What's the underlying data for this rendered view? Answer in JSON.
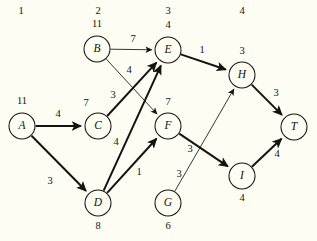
{
  "diagram": {
    "background_color": "#fdfdf4",
    "ink_color": "#14130f",
    "column_headers": [
      {
        "label": "1",
        "x": 21,
        "y": 14
      },
      {
        "label": "2",
        "x": 98,
        "y": 14
      },
      {
        "label": "3",
        "x": 168,
        "y": 14
      },
      {
        "label": "4",
        "x": 242,
        "y": 14
      }
    ],
    "nodes": [
      {
        "id": "A",
        "label": "A",
        "value": "11",
        "cx": 22,
        "cy": 126,
        "r": 13,
        "value_x": 22,
        "value_y": 104
      },
      {
        "id": "B",
        "label": "B",
        "value": "11",
        "cx": 97,
        "cy": 49,
        "r": 13,
        "value_x": 97,
        "value_y": 27
      },
      {
        "id": "C",
        "label": "C",
        "value": "7",
        "cx": 98,
        "cy": 126,
        "r": 13,
        "value_x": 86,
        "value_y": 106
      },
      {
        "id": "D",
        "label": "D",
        "value": "8",
        "cx": 98,
        "cy": 203,
        "r": 13,
        "value_x": 98,
        "value_y": 229
      },
      {
        "id": "E",
        "label": "E",
        "value": "4",
        "cx": 168,
        "cy": 50,
        "r": 13,
        "value_x": 168,
        "value_y": 28
      },
      {
        "id": "F",
        "label": "F",
        "value": "7",
        "cx": 168,
        "cy": 126,
        "r": 13,
        "value_x": 168,
        "value_y": 105
      },
      {
        "id": "G",
        "label": "G",
        "value": "6",
        "cx": 168,
        "cy": 203,
        "r": 13,
        "value_x": 168,
        "value_y": 229
      },
      {
        "id": "H",
        "label": "H",
        "value": "3",
        "cx": 242,
        "cy": 75,
        "r": 13,
        "value_x": 242,
        "value_y": 54
      },
      {
        "id": "I",
        "label": "I",
        "value": "4",
        "cx": 242,
        "cy": 176,
        "r": 13,
        "value_x": 242,
        "value_y": 201
      },
      {
        "id": "T",
        "label": "T",
        "value": "",
        "cx": 294,
        "cy": 127,
        "r": 13,
        "value_x": 294,
        "value_y": 150
      }
    ],
    "edges": [
      {
        "id": "A-C",
        "from": "A",
        "to": "C",
        "weight": "4",
        "style": "thick",
        "arrow": true,
        "label_x": 58,
        "label_y": 117
      },
      {
        "id": "A-D",
        "from": "A",
        "to": "D",
        "weight": "3",
        "style": "thick",
        "arrow": true,
        "label_x": 50,
        "label_y": 184
      },
      {
        "id": "B-E",
        "from": "B",
        "to": "E",
        "weight": "7",
        "style": "thin",
        "arrow": true,
        "label_x": 133,
        "label_y": 42
      },
      {
        "id": "B-F",
        "from": "B",
        "to": "F",
        "weight": "4",
        "style": "thin",
        "arrow": true,
        "label_x": 129,
        "label_y": 73
      },
      {
        "id": "C-E",
        "from": "C",
        "to": "E",
        "weight": "3",
        "style": "thick",
        "arrow": true,
        "label_x": 113,
        "label_y": 98
      },
      {
        "id": "D-E",
        "from": "D",
        "to": "E",
        "weight": "4",
        "style": "thick",
        "arrow": true,
        "label_x": 116,
        "label_y": 145
      },
      {
        "id": "D-F",
        "from": "D",
        "to": "F",
        "weight": "1",
        "style": "thick",
        "arrow": true,
        "label_x": 139,
        "label_y": 175
      },
      {
        "id": "E-H",
        "from": "E",
        "to": "H",
        "weight": "1",
        "style": "thick",
        "arrow": true,
        "label_x": 202,
        "label_y": 53
      },
      {
        "id": "F-I",
        "from": "F",
        "to": "I",
        "weight": "3",
        "style": "thick",
        "arrow": true,
        "label_x": 190,
        "label_y": 152
      },
      {
        "id": "G-H",
        "from": "G",
        "to": "H",
        "weight": "3",
        "style": "thin",
        "arrow": true,
        "label_x": 179,
        "label_y": 177
      },
      {
        "id": "H-T",
        "from": "H",
        "to": "T",
        "weight": "3",
        "style": "thick",
        "arrow": true,
        "label_x": 276,
        "label_y": 96
      },
      {
        "id": "I-T",
        "from": "I",
        "to": "T",
        "weight": "4",
        "style": "thick",
        "arrow": true,
        "label_x": 277,
        "label_y": 157
      }
    ]
  }
}
